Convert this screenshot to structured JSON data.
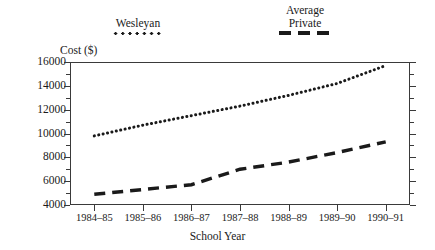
{
  "legend": {
    "entries": [
      {
        "label": "Wesleyan",
        "style": "dotted"
      },
      {
        "label_line1": "Average",
        "label_line2": "Private",
        "style": "dashed"
      }
    ],
    "wesleyan_label": "Wesleyan",
    "average_line1": "Average",
    "average_line2": "Private"
  },
  "axes": {
    "y_title": "Cost ($)",
    "x_title": "School Year"
  },
  "chart_data": {
    "type": "line",
    "title": "",
    "subtitle": "",
    "xlabel": "School Year",
    "ylabel": "Cost ($)",
    "categories": [
      "1984–85",
      "1985–86",
      "1986–87",
      "1987–88",
      "1988–89",
      "1989–90",
      "1990–91"
    ],
    "ylim": [
      4000,
      16000
    ],
    "ytick_labels": [
      "4000",
      "6000",
      "8000",
      "10000",
      "12000",
      "14000",
      "16000"
    ],
    "yticks": [
      4000,
      6000,
      8000,
      10000,
      12000,
      14000,
      16000
    ],
    "y_minor_tick_interval": 1000,
    "grid": false,
    "legend_position": "above-plot",
    "series": [
      {
        "name": "Wesleyan",
        "style": "dotted",
        "color": "#1a1a1a",
        "values": [
          9800,
          10700,
          11500,
          12300,
          13200,
          14200,
          15700
        ]
      },
      {
        "name": "Average Private",
        "style": "dashed",
        "color": "#1a1a1a",
        "values": [
          4900,
          5300,
          5700,
          7000,
          7600,
          8400,
          9300
        ]
      }
    ]
  },
  "colors": {
    "ink": "#1a1a1a",
    "frame": "#3a3a3a",
    "background": "#ffffff"
  }
}
